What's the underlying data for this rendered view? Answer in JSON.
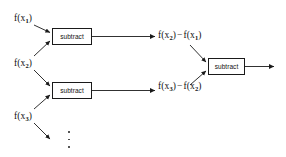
{
  "diagram": {
    "background_color": "#ffffff",
    "line_color": "#1a1a1a",
    "inputs": [
      {
        "id": "f-x1",
        "text": "f(x₁)",
        "base": "f(x",
        "sub": "1",
        "close": ")",
        "x": 14,
        "y": 14
      },
      {
        "id": "f-x2",
        "text": "f(x₂)",
        "base": "f(x",
        "sub": "2",
        "close": ")",
        "x": 14,
        "y": 59
      },
      {
        "id": "f-x3",
        "text": "f(x₃)",
        "base": "f(x",
        "sub": "3",
        "close": ")",
        "x": 14,
        "y": 112
      }
    ],
    "intermediate_outputs": [
      {
        "id": "diff-1",
        "text": "f(x₂) − f(x₁)",
        "left_base": "f(x",
        "left_sub": "2",
        "left_close": ")",
        "operator": "−",
        "right_base": "f(x",
        "right_sub": "1",
        "right_close": ")",
        "x": 158,
        "y": 31
      },
      {
        "id": "diff-2",
        "text": "f(x₃) − f(x₂)",
        "left_base": "f(x",
        "left_sub": "3",
        "left_close": ")",
        "operator": "−",
        "right_base": "f(x",
        "right_sub": "2",
        "right_close": ")",
        "x": 158,
        "y": 82
      }
    ],
    "operations": [
      {
        "id": "subtract-1",
        "label": "subtract",
        "x": 52,
        "y": 28,
        "w": 40,
        "h": 17
      },
      {
        "id": "subtract-2",
        "label": "subtract",
        "x": 52,
        "y": 82,
        "w": 40,
        "h": 17
      },
      {
        "id": "subtract-3",
        "label": "subtract",
        "x": 208,
        "y": 58,
        "w": 37,
        "h": 17
      }
    ],
    "ellipsis": {
      "id": "vertical-ellipsis",
      "symbol": "⋮",
      "dot_count": 3,
      "x": 67,
      "y": 131
    },
    "final_output": {
      "id": "final-arrow",
      "from_x": 245,
      "to_x": 274,
      "y": 66
    }
  }
}
